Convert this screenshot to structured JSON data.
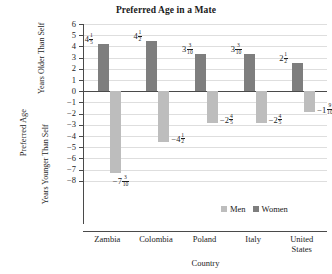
{
  "chart_data": {
    "type": "bar",
    "title": "Preferred Age in a Mate",
    "xlabel": "Country",
    "ylabel": "Preferred Age",
    "ylabel_upper": "Years Older Than Self",
    "ylabel_lower": "Years Younger Than Self",
    "categories": [
      "Zambia",
      "Colombia",
      "Poland",
      "Italy",
      "United States"
    ],
    "ylim": [
      -8,
      6
    ],
    "ytick_labels": [
      "6",
      "5",
      "4",
      "3",
      "2",
      "1",
      "0",
      "−1",
      "−2",
      "−3",
      "−4",
      "−5",
      "−6",
      "−7",
      "−8"
    ],
    "ytick_values": [
      6,
      5,
      4,
      3,
      2,
      1,
      0,
      -1,
      -2,
      -3,
      -4,
      -5,
      -6,
      -7,
      -8
    ],
    "grid": true,
    "legend_position": "inside-bottom-right",
    "series": [
      {
        "name": "Women",
        "color": "#7e7e7e",
        "values": [
          4.2,
          4.5,
          3.3,
          3.3,
          2.5
        ],
        "labels": [
          {
            "whole": "4",
            "num": "1",
            "den": "5",
            "text": "4 1/5"
          },
          {
            "whole": "4",
            "num": "1",
            "den": "2",
            "text": "4 1/2"
          },
          {
            "whole": "3",
            "num": "3",
            "den": "10",
            "text": "3 3/10"
          },
          {
            "whole": "3",
            "num": "3",
            "den": "10",
            "text": "3 3/10"
          },
          {
            "whole": "2",
            "num": "1",
            "den": "2",
            "text": "2 1/2"
          }
        ]
      },
      {
        "name": "Men",
        "color": "#bdbdbd",
        "values": [
          -7.3,
          -4.5,
          -2.8,
          -2.8,
          -1.9
        ],
        "labels": [
          {
            "whole": "−7",
            "num": "3",
            "den": "10",
            "text": "-7 3/10"
          },
          {
            "whole": "−4",
            "num": "1",
            "den": "2",
            "text": "-4 1/2"
          },
          {
            "whole": "−2",
            "num": "4",
            "den": "5",
            "text": "-2 4/5"
          },
          {
            "whole": "−2",
            "num": "4",
            "den": "5",
            "text": "-2 4/5"
          },
          {
            "whole": "−1",
            "num": "9",
            "den": "10",
            "text": "-1 9/10"
          }
        ]
      }
    ],
    "legend": [
      {
        "label": "Men",
        "color": "#bdbdbd"
      },
      {
        "label": "Women",
        "color": "#7e7e7e"
      }
    ]
  }
}
